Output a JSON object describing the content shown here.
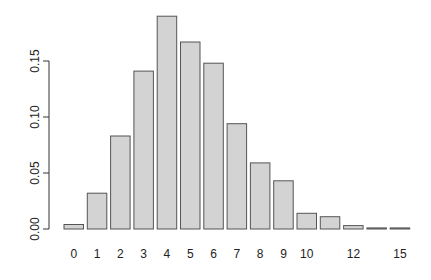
{
  "chart_data": {
    "type": "bar",
    "title": "",
    "xlabel": "",
    "ylabel": "",
    "categories": [
      "0",
      "1",
      "2",
      "3",
      "4",
      "5",
      "6",
      "7",
      "8",
      "9",
      "10",
      "11",
      "12",
      "14",
      "15"
    ],
    "visible_x_labels": [
      "0",
      "1",
      "2",
      "3",
      "4",
      "5",
      "6",
      "7",
      "8",
      "9",
      "10",
      "12",
      "15"
    ],
    "values": [
      0.004,
      0.032,
      0.083,
      0.141,
      0.19,
      0.167,
      0.148,
      0.094,
      0.059,
      0.043,
      0.014,
      0.011,
      0.003,
      0.001,
      0.001
    ],
    "ylim": [
      0,
      0.19
    ],
    "y_ticks": [
      0.0,
      0.05,
      0.1,
      0.15
    ],
    "y_tick_labels": [
      "0.00",
      "0.05",
      "0.10",
      "0.15"
    ],
    "grid": false,
    "legend": null,
    "bar_fill": "#d3d3d3",
    "bar_border": "#555555"
  }
}
